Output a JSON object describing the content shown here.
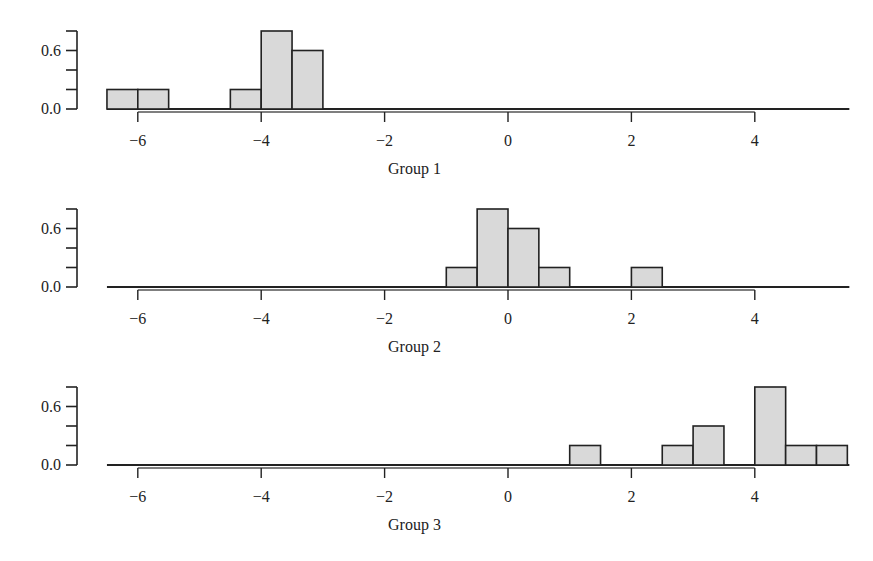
{
  "chart_data": {
    "type": "bar",
    "kind": "histogram",
    "layout": "three vertically stacked panels sharing x scale",
    "bin_width": 0.5,
    "xlim": [
      -6.5,
      5.5
    ],
    "ylim": [
      0.0,
      0.8
    ],
    "xticks": [
      -6,
      -4,
      -2,
      0,
      2,
      4
    ],
    "xtick_labels": [
      "−6",
      "−4",
      "−2",
      "0",
      "2",
      "4"
    ],
    "yticks": [
      0.0,
      0.2,
      0.4,
      0.6,
      0.8
    ],
    "ytick_labels_shown": {
      "0.0": "0.0",
      "0.6": "0.6"
    },
    "grid": false,
    "legend": null,
    "colors": {
      "bar_fill": "#d9d9d9",
      "bar_stroke": "#222222",
      "axis": "#222222"
    },
    "panels": [
      {
        "name": "Group 1",
        "xlabel": "Group 1",
        "bins": [
          {
            "x0": -6.5,
            "x1": -6.0,
            "density": 0.2
          },
          {
            "x0": -6.0,
            "x1": -5.5,
            "density": 0.2
          },
          {
            "x0": -4.5,
            "x1": -4.0,
            "density": 0.2
          },
          {
            "x0": -4.0,
            "x1": -3.5,
            "density": 0.8
          },
          {
            "x0": -3.5,
            "x1": -3.0,
            "density": 0.6
          }
        ]
      },
      {
        "name": "Group 2",
        "xlabel": "Group 2",
        "bins": [
          {
            "x0": -1.0,
            "x1": -0.5,
            "density": 0.2
          },
          {
            "x0": -0.5,
            "x1": 0.0,
            "density": 0.8
          },
          {
            "x0": 0.0,
            "x1": 0.5,
            "density": 0.6
          },
          {
            "x0": 0.5,
            "x1": 1.0,
            "density": 0.2
          },
          {
            "x0": 2.0,
            "x1": 2.5,
            "density": 0.2
          }
        ]
      },
      {
        "name": "Group 3",
        "xlabel": "Group 3",
        "bins": [
          {
            "x0": 1.0,
            "x1": 1.5,
            "density": 0.2
          },
          {
            "x0": 2.5,
            "x1": 3.0,
            "density": 0.2
          },
          {
            "x0": 3.0,
            "x1": 3.5,
            "density": 0.4
          },
          {
            "x0": 4.0,
            "x1": 4.5,
            "density": 0.8
          },
          {
            "x0": 4.5,
            "x1": 5.0,
            "density": 0.2
          },
          {
            "x0": 5.0,
            "x1": 5.5,
            "density": 0.2
          }
        ]
      }
    ]
  }
}
